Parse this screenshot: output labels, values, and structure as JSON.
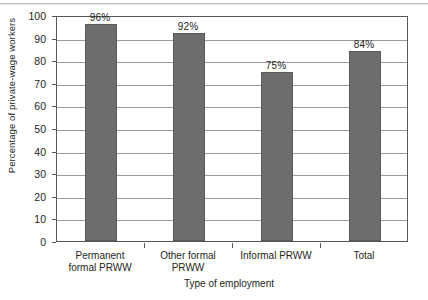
{
  "chart_data": {
    "type": "bar",
    "title": "",
    "subtitle": "",
    "xlabel": "Type of employment",
    "ylabel": "Percentage of private-wage workers",
    "categories": [
      "Permanent formal PRWW",
      "Other formal PRWW",
      "Informal PRWW",
      "Total"
    ],
    "category_lines": [
      [
        "Permanent",
        "formal PRWW"
      ],
      [
        "Other formal",
        "PRWW"
      ],
      [
        "Informal PRWW",
        ""
      ],
      [
        "Total",
        ""
      ]
    ],
    "values": [
      96,
      92,
      75,
      84
    ],
    "data_labels": [
      "96%",
      "92%",
      "75%",
      "84%"
    ],
    "ylim": [
      0,
      100
    ],
    "ytick_values": [
      0,
      10,
      20,
      30,
      40,
      50,
      60,
      70,
      80,
      90,
      100
    ],
    "ytick_labels": [
      "0",
      "10",
      "20",
      "30",
      "40",
      "50",
      "60",
      "70",
      "80",
      "90",
      "100"
    ],
    "grid": "horizontal",
    "legend": "none",
    "series": [
      {
        "name": "Percentage of private-wage workers",
        "values": [
          96,
          92,
          75,
          84
        ]
      }
    ],
    "colors": {
      "bar_fill": "#6d6d6d",
      "bar_stroke": "#5a5a5a",
      "gridline": "#9a9a9c",
      "axis": "#58585a",
      "text": "#231f20",
      "background": "#ffffff"
    }
  }
}
